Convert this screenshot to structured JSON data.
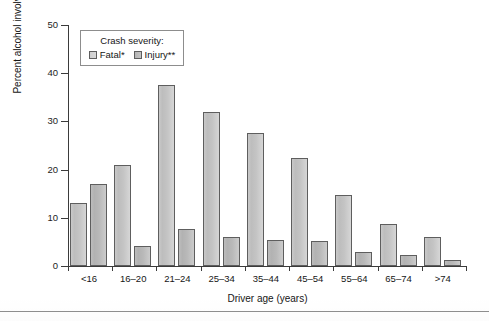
{
  "chart_data": {
    "type": "bar",
    "title": "",
    "xlabel": "Driver age (years)",
    "ylabel": "Percent alcohol involvement",
    "ylim": [
      0,
      50
    ],
    "yticks": [
      0,
      10,
      20,
      30,
      40,
      50
    ],
    "grid": false,
    "legend_position": "top-left-inside",
    "legend_title": "Crash severity:",
    "categories": [
      "<16",
      "16–20",
      "21–24",
      "25–34",
      "35–44",
      "45–54",
      "55–64",
      "65–74",
      ">74"
    ],
    "series": [
      {
        "name": "Fatal*",
        "values": [
          13.0,
          21.0,
          37.5,
          32.0,
          27.5,
          22.5,
          14.7,
          8.7,
          6.0
        ]
      },
      {
        "name": "Injury**",
        "values": [
          17.0,
          4.2,
          7.7,
          6.1,
          5.3,
          5.2,
          3.0,
          2.2,
          1.2
        ]
      }
    ]
  },
  "legend": {
    "title": "Crash severity:",
    "items": [
      {
        "label": "Fatal*",
        "swatch": "legend-swatch-fatal"
      },
      {
        "label": "Injury**",
        "swatch": "legend-swatch-injury"
      }
    ]
  },
  "axes": {
    "y_title": "Percent alcohol involvement",
    "x_title": "Driver age (years)",
    "y_tick_labels": [
      "0",
      "10",
      "20",
      "30",
      "40",
      "50"
    ],
    "x_tick_labels": [
      "<16",
      "16–20",
      "21–24",
      "25–34",
      "35–44",
      "45–54",
      "55–64",
      "65–74",
      ">74"
    ]
  },
  "style": {
    "axis_color": "#3b3b3b",
    "bar_outline": "#5e5e5e",
    "fatal_fill": "#c9c9c9",
    "injury_fill": "#b6b6b6",
    "background": "#ffffff",
    "rule_color": "#8f8f8f"
  }
}
